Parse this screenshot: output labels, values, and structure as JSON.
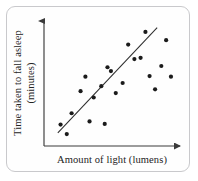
{
  "figure": {
    "kind": "scatter-plot",
    "frame_border_color": "#c9c9cc",
    "background_color": "#fefefe"
  },
  "axes": {
    "x_label": "Amount of light (lumens)",
    "y_label_line1": "Time taken to fall asleep",
    "y_label_line2": "(minutes)",
    "axis_color": "#3a3a3a",
    "x_axis_has_arrow": true,
    "y_axis_has_arrow": true
  },
  "chart_data": {
    "type": "scatter",
    "title": "",
    "xlabel": "Amount of light (lumens)",
    "ylabel": "Time taken to fall asleep (minutes)",
    "xlim": [
      0,
      100
    ],
    "ylim": [
      0,
      100
    ],
    "grid": false,
    "legend": "none",
    "point_color": "#1b1b1b",
    "point_radius_px": 2.1,
    "relationship": "positive linear correlation",
    "points": [
      {
        "x": 12.0,
        "y": 17.0
      },
      {
        "x": 16.5,
        "y": 9.5
      },
      {
        "x": 20.0,
        "y": 26.0
      },
      {
        "x": 26.5,
        "y": 43.5
      },
      {
        "x": 30.0,
        "y": 55.0
      },
      {
        "x": 33.0,
        "y": 19.5
      },
      {
        "x": 36.0,
        "y": 38.5
      },
      {
        "x": 41.5,
        "y": 47.5
      },
      {
        "x": 44.0,
        "y": 17.5
      },
      {
        "x": 46.0,
        "y": 62.5
      },
      {
        "x": 48.5,
        "y": 59.5
      },
      {
        "x": 52.0,
        "y": 42.0
      },
      {
        "x": 57.0,
        "y": 50.0
      },
      {
        "x": 61.0,
        "y": 80.5
      },
      {
        "x": 65.5,
        "y": 69.0
      },
      {
        "x": 70.0,
        "y": 70.0
      },
      {
        "x": 73.5,
        "y": 90.5
      },
      {
        "x": 76.5,
        "y": 55.5
      },
      {
        "x": 80.5,
        "y": 45.0
      },
      {
        "x": 85.0,
        "y": 63.5
      },
      {
        "x": 88.5,
        "y": 84.0
      },
      {
        "x": 92.0,
        "y": 55.0
      }
    ],
    "trend_line": {
      "label": "line of best fit",
      "x_start": 10.0,
      "y_start": 10.5,
      "x_end": 82.0,
      "y_end": 94.0,
      "color": "#2e2e2e"
    }
  }
}
